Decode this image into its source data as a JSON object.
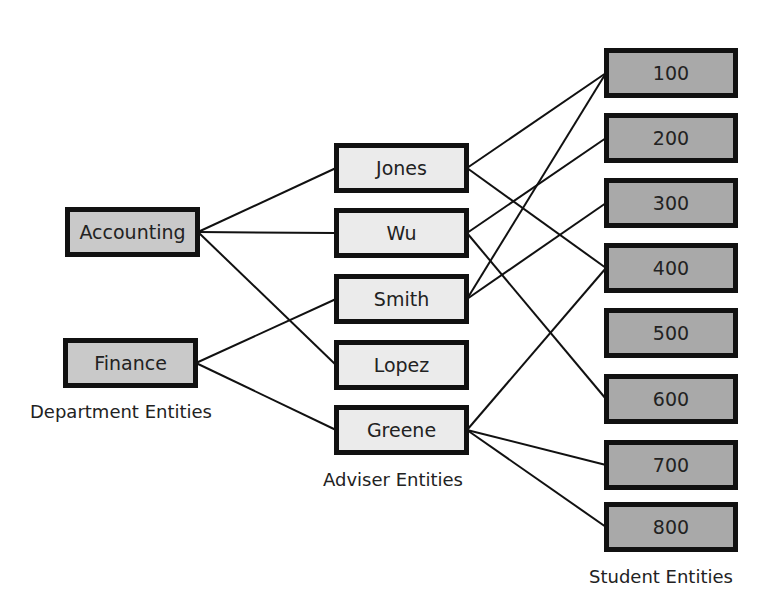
{
  "departments": [
    {
      "id": "accounting",
      "label": "Accounting",
      "x": 65,
      "y": 207,
      "w": 135,
      "h": 50
    },
    {
      "id": "finance",
      "label": "Finance",
      "x": 63,
      "y": 338,
      "w": 135,
      "h": 50
    }
  ],
  "advisers": [
    {
      "id": "jones",
      "label": "Jones",
      "x": 334,
      "y": 143,
      "w": 135,
      "h": 50
    },
    {
      "id": "wu",
      "label": "Wu",
      "x": 334,
      "y": 208,
      "w": 135,
      "h": 50
    },
    {
      "id": "smith",
      "label": "Smith",
      "x": 334,
      "y": 274,
      "w": 135,
      "h": 50
    },
    {
      "id": "lopez",
      "label": "Lopez",
      "x": 334,
      "y": 340,
      "w": 135,
      "h": 50
    },
    {
      "id": "greene",
      "label": "Greene",
      "x": 334,
      "y": 405,
      "w": 135,
      "h": 50
    }
  ],
  "students": [
    {
      "id": "s100",
      "label": "100",
      "x": 604,
      "y": 48,
      "w": 134,
      "h": 50
    },
    {
      "id": "s200",
      "label": "200",
      "x": 604,
      "y": 113,
      "w": 134,
      "h": 50
    },
    {
      "id": "s300",
      "label": "300",
      "x": 604,
      "y": 178,
      "w": 134,
      "h": 50
    },
    {
      "id": "s400",
      "label": "400",
      "x": 604,
      "y": 243,
      "w": 134,
      "h": 50
    },
    {
      "id": "s500",
      "label": "500",
      "x": 604,
      "y": 308,
      "w": 134,
      "h": 50
    },
    {
      "id": "s600",
      "label": "600",
      "x": 604,
      "y": 374,
      "w": 134,
      "h": 50
    },
    {
      "id": "s700",
      "label": "700",
      "x": 604,
      "y": 440,
      "w": 134,
      "h": 50
    },
    {
      "id": "s800",
      "label": "800",
      "x": 604,
      "y": 502,
      "w": 134,
      "h": 50
    }
  ],
  "labels": {
    "department": "Department Entities",
    "adviser": "Adviser Entities",
    "student": "Student Entities"
  },
  "links": [
    [
      "accounting",
      "jones"
    ],
    [
      "accounting",
      "wu"
    ],
    [
      "accounting",
      "lopez"
    ],
    [
      "finance",
      "smith"
    ],
    [
      "finance",
      "greene"
    ],
    [
      "jones",
      "s100"
    ],
    [
      "jones",
      "s400"
    ],
    [
      "wu",
      "s200"
    ],
    [
      "wu",
      "s600"
    ],
    [
      "smith",
      "s100"
    ],
    [
      "smith",
      "s300"
    ],
    [
      "greene",
      "s400"
    ],
    [
      "greene",
      "s700"
    ],
    [
      "greene",
      "s800"
    ]
  ]
}
